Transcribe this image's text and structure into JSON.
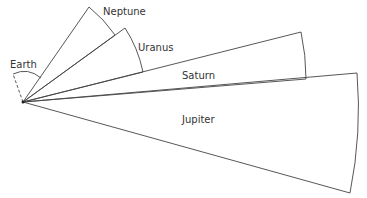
{
  "diagram": {
    "title": "",
    "labels": {
      "earth": "Earth",
      "neptune": "Neptune",
      "uranus": "Uranus",
      "saturn": "Saturn",
      "jupiter": "Jupiter"
    },
    "apex": [
      23,
      102
    ],
    "sectors": [
      {
        "name": "Neptune",
        "style": "hatched",
        "upper": [
          89,
          7
        ],
        "lower": [
          115,
          35
        ]
      },
      {
        "name": "Uranus",
        "style": "plain",
        "upper": [
          125,
          28
        ],
        "lower": [
          143,
          72
        ]
      },
      {
        "name": "Saturn",
        "style": "hatched",
        "upper": [
          301,
          32
        ],
        "lower": [
          306,
          79
        ]
      },
      {
        "name": "Jupiter",
        "style": "plain",
        "upper": [
          357,
          73
        ],
        "lower": [
          350,
          193
        ]
      },
      {
        "name": "Earth",
        "style": "dashed",
        "upper": [
          13,
          75
        ],
        "lower": [
          40,
          78
        ]
      }
    ],
    "colors": {
      "line": "#444444",
      "text": "#333333",
      "background": "#ffffff"
    }
  }
}
